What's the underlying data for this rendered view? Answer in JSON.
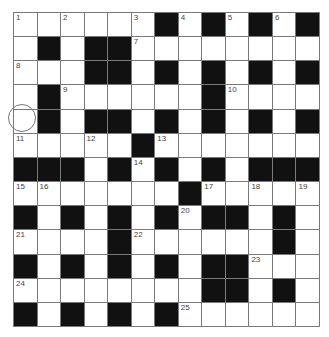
{
  "puzzle": {
    "rows": 13,
    "cols": 13,
    "colors": {
      "black": "#111111",
      "white": "#ffffff",
      "gridline": "#7a7a7a",
      "number": "#444444"
    },
    "layout": [
      "1 . 2 . . 3 # 4 # 5 # 6 #",
      ". # . # # 7 . . . . . . .",
      "8 . . # # . # . # . # . #",
      ". # 9 . . . . . # 10 . . .",
      ". # . # # . # . # . # . #",
      "11 . . 12 . # 13 . . . . . .",
      "# # # . # 14 # . # . # # #",
      "15 16 . . . . . # 17 . 18 . 19",
      "# . # . # . # 20 # # . # .",
      "21 . . . # 22 . . . . . # .",
      "# . # . # . # . # # 23 . .",
      "24 . . . . . . . # # . # .",
      "# . # . # . # 25 . . . . ."
    ],
    "selected_cell": {
      "row": 4,
      "col": 0,
      "indicator": "circle"
    }
  }
}
